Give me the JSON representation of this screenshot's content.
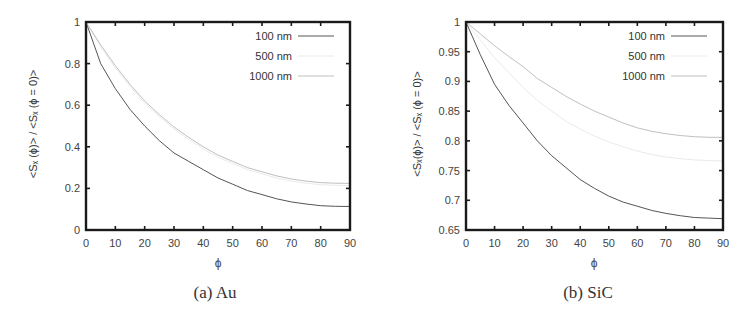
{
  "figure": {
    "panels": [
      {
        "caption": "(a)  Au",
        "ylabel": "<Sₓ (ϕ)> / <Sₓ (ϕ = 0)>",
        "xlabel": "ϕ"
      },
      {
        "caption": "(b)  SiC",
        "ylabel": "<Sₓ(ϕ)> / <Sₓ (ϕ = 0)>",
        "xlabel": "ϕ"
      }
    ]
  },
  "chart_data": [
    {
      "type": "line",
      "title": "(a) Au",
      "xlabel": "ϕ",
      "ylabel": "<S_z(ϕ)> / <S_z(ϕ = 0)>",
      "xlim": [
        0,
        90
      ],
      "ylim": [
        0,
        1
      ],
      "xticks": [
        0,
        10,
        20,
        30,
        40,
        50,
        60,
        70,
        80,
        90
      ],
      "yticks": [
        0,
        0.2,
        0.4,
        0.6,
        0.8,
        1
      ],
      "ytick_labels": [
        "0",
        "0.2",
        "0.4",
        "0.6",
        "0.8",
        "1"
      ],
      "grid": false,
      "legend_position": "top-right",
      "x": [
        0,
        5,
        10,
        15,
        20,
        25,
        30,
        35,
        40,
        45,
        50,
        55,
        60,
        65,
        70,
        75,
        80,
        85,
        90
      ],
      "series": [
        {
          "name": "100 nm",
          "color": "#555555",
          "width": 1.0,
          "values": [
            1.0,
            0.8,
            0.68,
            0.58,
            0.5,
            0.43,
            0.37,
            0.33,
            0.29,
            0.25,
            0.22,
            0.19,
            0.17,
            0.15,
            0.135,
            0.125,
            0.117,
            0.114,
            0.113
          ]
        },
        {
          "name": "500 nm",
          "color": "#e4e4e4",
          "width": 0.8,
          "values": [
            1.0,
            0.88,
            0.78,
            0.69,
            0.61,
            0.545,
            0.485,
            0.435,
            0.39,
            0.35,
            0.32,
            0.29,
            0.27,
            0.25,
            0.235,
            0.225,
            0.218,
            0.215,
            0.214
          ]
        },
        {
          "name": "1000 nm",
          "color": "#b8b8b8",
          "width": 0.9,
          "values": [
            1.0,
            0.89,
            0.79,
            0.7,
            0.62,
            0.555,
            0.495,
            0.445,
            0.4,
            0.36,
            0.33,
            0.3,
            0.28,
            0.26,
            0.245,
            0.235,
            0.228,
            0.225,
            0.224
          ]
        }
      ]
    },
    {
      "type": "line",
      "title": "(b) SiC",
      "xlabel": "ϕ",
      "ylabel": "<S_z(ϕ)> / <S_z(ϕ = 0)>",
      "xlim": [
        0,
        90
      ],
      "ylim": [
        0.65,
        1
      ],
      "xticks": [
        0,
        10,
        20,
        30,
        40,
        50,
        60,
        70,
        80,
        90
      ],
      "yticks": [
        0.65,
        0.7,
        0.75,
        0.8,
        0.85,
        0.9,
        0.95,
        1
      ],
      "ytick_labels": [
        "0.65",
        "0.7",
        "0.75",
        "0.8",
        "0.85",
        "0.9",
        "0.95",
        "1"
      ],
      "grid": false,
      "legend_position": "top-right",
      "x": [
        0,
        5,
        10,
        15,
        20,
        25,
        30,
        35,
        40,
        45,
        50,
        55,
        60,
        65,
        70,
        75,
        80,
        85,
        90
      ],
      "series": [
        {
          "name": "100 nm",
          "color": "#555555",
          "width": 1.0,
          "values": [
            1.0,
            0.945,
            0.895,
            0.86,
            0.83,
            0.8,
            0.775,
            0.755,
            0.735,
            0.72,
            0.707,
            0.697,
            0.69,
            0.683,
            0.678,
            0.674,
            0.671,
            0.67,
            0.669
          ]
        },
        {
          "name": "500 nm",
          "color": "#e4e4e4",
          "width": 0.8,
          "values": [
            1.0,
            0.97,
            0.94,
            0.915,
            0.89,
            0.868,
            0.85,
            0.833,
            0.82,
            0.808,
            0.798,
            0.79,
            0.783,
            0.777,
            0.773,
            0.77,
            0.768,
            0.767,
            0.766
          ]
        },
        {
          "name": "1000 nm",
          "color": "#b8b8b8",
          "width": 0.9,
          "values": [
            1.0,
            0.98,
            0.96,
            0.942,
            0.925,
            0.905,
            0.89,
            0.875,
            0.862,
            0.85,
            0.84,
            0.83,
            0.822,
            0.816,
            0.812,
            0.809,
            0.807,
            0.806,
            0.806
          ]
        }
      ]
    }
  ]
}
